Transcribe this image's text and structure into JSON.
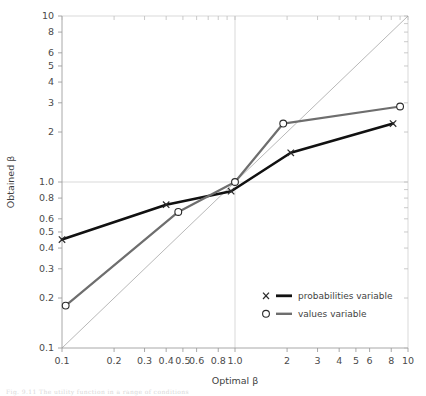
{
  "figure": {
    "caption_fragment": "Fig. 9.11     The utility function in a range of conditions"
  },
  "legend": {
    "position": "inside-lower-right",
    "entries": [
      {
        "marker": "X",
        "label": "probabilities variable",
        "color": "#111111"
      },
      {
        "marker": "O",
        "label": "values variable",
        "color": "#6e6e6e"
      }
    ]
  },
  "chart_data": {
    "type": "line",
    "title": "",
    "xlabel": "Optimal β",
    "ylabel": "Obtained β",
    "xscale": "log",
    "yscale": "log",
    "xlim": [
      0.1,
      10
    ],
    "ylim": [
      0.1,
      10
    ],
    "grid": true,
    "gridlines": {
      "x": [
        1.0
      ],
      "y": [
        1.0
      ]
    },
    "xticks": [
      0.1,
      0.2,
      0.3,
      0.4,
      0.5,
      0.6,
      0.8,
      1.0,
      2,
      3,
      4,
      5,
      6,
      8,
      10
    ],
    "xticklabels": [
      "0.1",
      "0.2",
      "0.3",
      "0.4",
      "0.5",
      "0.6",
      "0.8",
      "1.0",
      "2",
      "3",
      "4",
      "5",
      "6",
      "8",
      "10"
    ],
    "yticks": [
      0.1,
      0.2,
      0.3,
      0.4,
      0.5,
      0.6,
      0.8,
      1.0,
      2,
      3,
      4,
      5,
      6,
      8,
      10
    ],
    "yticklabels": [
      "0.1",
      "0.2",
      "0.3",
      "0.4",
      "0.5",
      "0.6",
      "0.8",
      "1.0",
      "2",
      "3",
      "4",
      "5",
      "6",
      "8",
      "10"
    ],
    "reference_line": {
      "name": "identity",
      "x": [
        0.1,
        10
      ],
      "y": [
        0.1,
        10
      ],
      "color": "#9a9a9a",
      "width": 0.7
    },
    "series": [
      {
        "name": "probabilities variable",
        "marker": "X",
        "color": "#111111",
        "width": 2.6,
        "x": [
          0.1,
          0.4,
          0.95,
          2.1,
          8.2
        ],
        "y": [
          0.45,
          0.73,
          0.88,
          1.5,
          2.25
        ]
      },
      {
        "name": "values variable",
        "marker": "O",
        "color": "#6e6e6e",
        "width": 2.2,
        "x": [
          0.105,
          0.47,
          1.0,
          1.9,
          9.0
        ],
        "y": [
          0.18,
          0.66,
          1.0,
          2.25,
          2.85
        ]
      }
    ]
  }
}
